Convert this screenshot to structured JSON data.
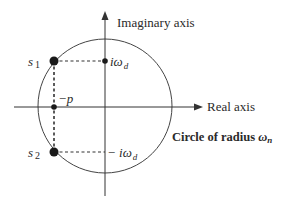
{
  "diagram": {
    "axes": {
      "imaginary_label": "Imaginary axis",
      "real_label": "Real axis"
    },
    "circle": {
      "label_prefix": "Circle of radius ",
      "label_symbol": "ω",
      "label_subscript": "n"
    },
    "points": {
      "s1": {
        "name": "s",
        "subscript": "1"
      },
      "s2": {
        "name": "s",
        "subscript": "2"
      },
      "neg_p": {
        "label": "−p"
      },
      "i_omega_d": {
        "prefix": "iω",
        "subscript": "d"
      },
      "neg_i_omega_d": {
        "prefix": "− iω",
        "subscript": "d"
      }
    },
    "colors": {
      "stroke": "#333333",
      "text": "#2a2a2a",
      "background": "#ffffff"
    }
  }
}
